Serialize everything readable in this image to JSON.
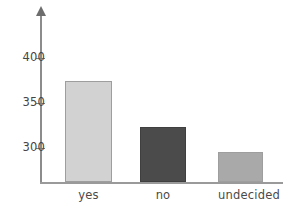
{
  "chart_data": {
    "type": "bar",
    "title": "",
    "subtitle": "",
    "xlabel": "",
    "ylabel": "",
    "categories": [
      "yes",
      "no",
      "undecided"
    ],
    "values": [
      375,
      323,
      296
    ],
    "series": [
      {
        "name": "",
        "values": [
          375,
          323,
          296
        ]
      }
    ],
    "bar_colors": [
      "#d2d2d2",
      "#4b4b4b",
      "#a9a9a9"
    ],
    "bar_border_colors": [
      "#9e9e9e",
      "#3f3f3f",
      "#9e9e9e"
    ],
    "ytick_labels": [
      "400",
      "350",
      "300"
    ],
    "ytick_values": [
      400,
      350,
      300
    ],
    "ylim": [
      275,
      420
    ],
    "grid": false,
    "legend": false,
    "legend_position": "none",
    "axis_color": "#8c8c8c",
    "text_color": "#454545",
    "background": "#ffffff",
    "annotations": []
  },
  "axes": {
    "y_axis_name": "y-axis",
    "x_axis_name": "x-axis",
    "arrow_icon": "arrow-up-icon"
  }
}
